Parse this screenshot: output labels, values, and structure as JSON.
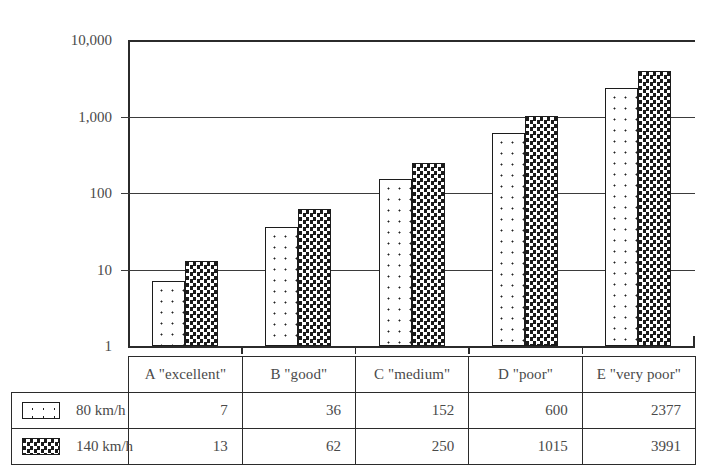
{
  "chart_data": {
    "type": "bar",
    "title": "",
    "xlabel": "",
    "ylabel": "Shock absorber power / vehicle [W]",
    "yscale": "log",
    "ylim": [
      1,
      10000
    ],
    "ytick_labels": [
      "10,000",
      "1,000",
      "100",
      "10",
      "1"
    ],
    "ytick_values": [
      10000,
      1000,
      100,
      10,
      1
    ],
    "grid": true,
    "legend_position": "table-left",
    "categories": [
      "A \"excellent\"",
      "B \"good\"",
      "C \"medium\"",
      "D \"poor\"",
      "E \"very poor\""
    ],
    "series": [
      {
        "name": "80 km/h",
        "pattern": "dots",
        "values": [
          7,
          36,
          152,
          600,
          2377
        ],
        "value_labels": [
          "7",
          "36",
          "152",
          "600",
          "2377"
        ]
      },
      {
        "name": "140 km/h",
        "pattern": "crosshatch",
        "values": [
          13,
          62,
          250,
          1015,
          3991
        ],
        "value_labels": [
          "13",
          "62",
          "250",
          "1015",
          "3991"
        ]
      }
    ]
  },
  "colors": {
    "axis": "#2b2b2b",
    "grid": "#3b3b3b",
    "text": "#4a4a4a",
    "series_light_fill": "#ffffff",
    "series_dark_fill": "#1a1a1a",
    "bar_outline": "#1c1c1c",
    "background": "#ffffff"
  }
}
